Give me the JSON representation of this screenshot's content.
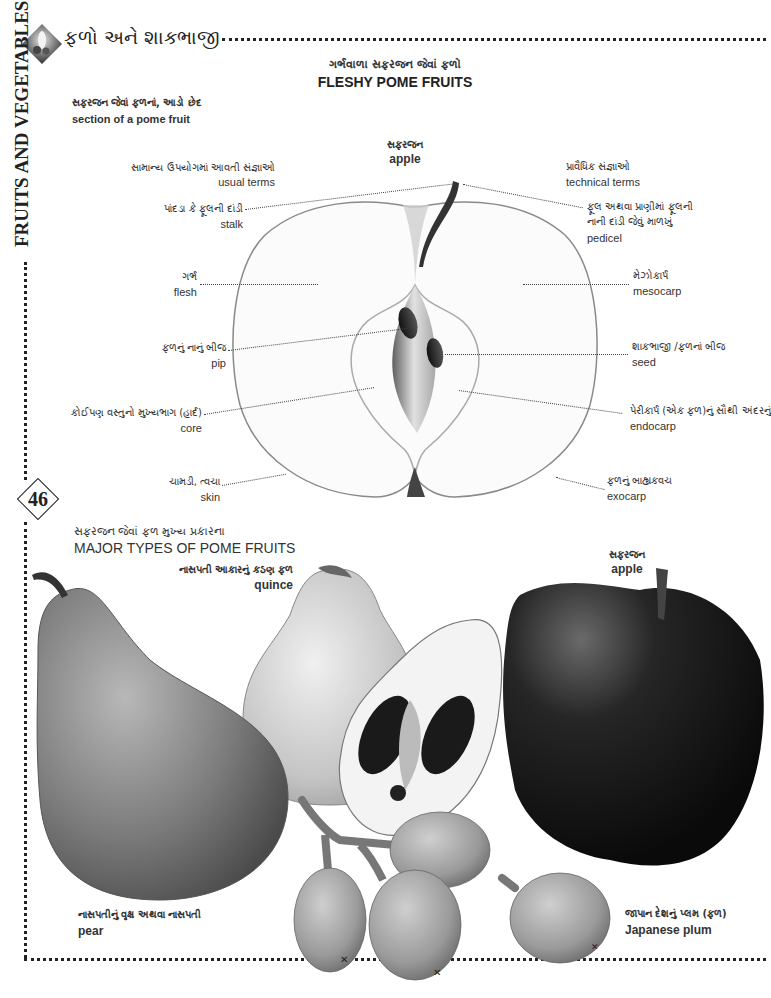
{
  "header": {
    "title_gu": "ફળો અને શાકભાજી",
    "side_title": "FRUITS AND VEGETABLES",
    "page_number": "46"
  },
  "section_main": {
    "title_gu": "ગર્ભવાળા સફરજન જેવાં ફળો",
    "title_en": "FLESHY POME FRUITS"
  },
  "section_cut": {
    "title_gu": "સફરજન જેવાં ફળનાં, આડો છેદ",
    "title_en": "section of a pome fruit"
  },
  "diagram": {
    "center_label": {
      "gu": "સફરજન",
      "en": "apple"
    },
    "usual_terms": {
      "gu": "સામાન્ય ઉપયોગમાં આવતી સંજ્ઞાઓ",
      "en": "usual terms"
    },
    "technical_terms": {
      "gu": "પ્રાવૈધિક સંજ્ઞાઓ",
      "en": "technical terms"
    },
    "left_labels": [
      {
        "gu": "પાંદડા કે ફૂલની દાંડી",
        "en": "stalk"
      },
      {
        "gu": "ગર્ભ",
        "en": "flesh"
      },
      {
        "gu": "ફળનું નાનું બીજ",
        "en": "pip"
      },
      {
        "gu": "કોઈપણ વસ્તુનો મુખ્યભાગ (હાર્દ)",
        "en": "core"
      },
      {
        "gu": "ચામડી, ત્વચા",
        "en": "skin"
      }
    ],
    "right_labels": [
      {
        "gu": "ફૂલ અથવા પ્રાણીમાં ફૂલની",
        "gu2": "નાની દાંડી જેવું માળખું",
        "en": "pedicel"
      },
      {
        "gu": "મેઝોકાર્પ",
        "en": "mesocarp"
      },
      {
        "gu": "શાકભાજી /ફળનાં બીજ",
        "en": "seed"
      },
      {
        "gu": "પેરીકાર્પ (એક ફળ)નું સૌથી અંદરનું",
        "en": "endocarp"
      },
      {
        "gu": "ફળનું બાહ્યકવચ",
        "en": "exocarp"
      }
    ]
  },
  "section_types": {
    "title_gu": "સફરજન જેવાં ફળ મુખ્ય પ્રકારના",
    "title_en": "MAJOR TYPES OF POME FRUITS"
  },
  "fruits": {
    "quince": {
      "gu": "નાસપતી આકારનું કઠણ ફળ",
      "en": "quince"
    },
    "apple": {
      "gu": "સફરજન",
      "en": "apple"
    },
    "pear": {
      "gu": "નાસપતીનું વૃક્ષ અથવા નાસપતી",
      "en": "pear"
    },
    "japanese_plum": {
      "gu": "જાપાન દેશનું પ્લમ (ફળ)",
      "en": "Japanese plum"
    }
  }
}
